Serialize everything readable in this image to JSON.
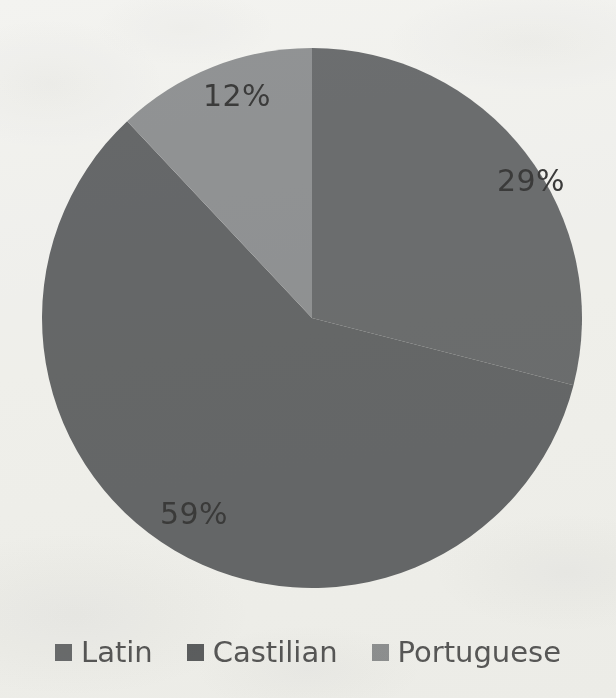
{
  "chart_data": {
    "type": "pie",
    "title": "",
    "subtitle": "",
    "xlabel": "",
    "ylabel": "",
    "grid": false,
    "legend_position": "bottom",
    "start_angle_deg": 0,
    "direction": "clockwise",
    "categories": [
      "Latin",
      "Castilian",
      "Portuguese"
    ],
    "values": [
      29,
      59,
      12
    ],
    "value_unit": "%",
    "slices": [
      {
        "label": "Latin",
        "value": 29,
        "data_label": "29%",
        "color": "#6e7072",
        "start_deg": 0,
        "end_deg": 104.4
      },
      {
        "label": "Castilian",
        "value": 59,
        "data_label": "59%",
        "color": "#686a6c",
        "start_deg": 104.4,
        "end_deg": 316.8
      },
      {
        "label": "Portuguese",
        "value": 12,
        "data_label": "12%",
        "color": "#949698",
        "start_deg": 316.8,
        "end_deg": 360
      }
    ]
  },
  "labels": {
    "latin_pct": "29%",
    "castilian_pct": "59%",
    "portuguese_pct": "12%"
  },
  "legend": {
    "items": [
      {
        "label": "Latin",
        "color": "#6e7072"
      },
      {
        "label": "Castilian",
        "color": "#5f6163"
      },
      {
        "label": "Portuguese",
        "color": "#939597"
      }
    ]
  },
  "colors": {
    "background": "#f7f7f5",
    "label_text": "#3c3c3c",
    "legend_text": "#5a5a5a"
  }
}
